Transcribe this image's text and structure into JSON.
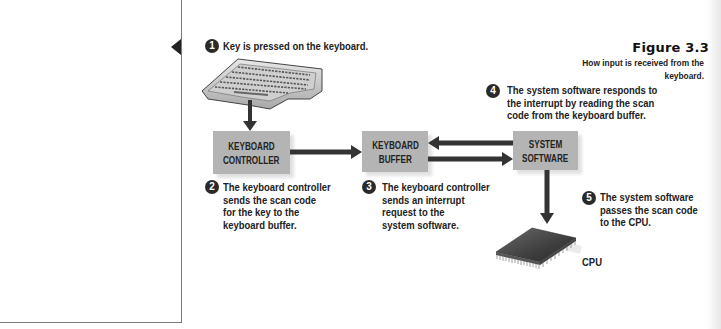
{
  "figure": {
    "title": "Figure 3.3",
    "caption": "How input is received from the keyboard."
  },
  "boxes": {
    "keyboard_controller": [
      "KEYBOARD",
      "CONTROLLER"
    ],
    "keyboard_buffer": [
      "KEYBOARD",
      "BUFFER"
    ],
    "system_software": [
      "SYSTEM",
      "SOFTWARE"
    ]
  },
  "steps": [
    {
      "num": "1",
      "text": "Key is pressed on the keyboard."
    },
    {
      "num": "2",
      "lines": [
        "The keyboard controller",
        "sends the scan code",
        "for the key to the",
        "keyboard buffer."
      ]
    },
    {
      "num": "3",
      "lines": [
        "The keyboard controller",
        "sends an interrupt",
        "request to the",
        "system software."
      ]
    },
    {
      "num": "4",
      "lines": [
        "The system software responds to",
        "the interrupt by reading the scan",
        "code from the keyboard buffer."
      ]
    },
    {
      "num": "5",
      "lines": [
        "The system software",
        "passes the scan code",
        "to the CPU."
      ]
    }
  ],
  "images": {
    "keyboard": "keyboard-image",
    "cpu": "cpu-chip-image"
  },
  "labels": {
    "cpu": "CPU"
  },
  "colors": {
    "box_fill": "#b4b4b4",
    "arrow": "#333333",
    "badge": "#2a2a2a",
    "border": "#7a7a7a"
  }
}
